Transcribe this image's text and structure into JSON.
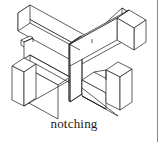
{
  "figure": {
    "caption": "notching",
    "alt_title": "notching",
    "drawing_type": "isometric-line-drawing",
    "stroke_color": "#1a1a1a",
    "fill_color": "#ffffff",
    "background_color": "#ffffff",
    "stroke_width": 0.7,
    "parts": [
      {
        "name": "horizontal-beam",
        "label": "horizontal beam running upper-left to lower-right"
      },
      {
        "name": "crossing-beam",
        "label": "crossing beam running upper-right to lower-left"
      },
      {
        "name": "left-notch-block",
        "label": "left notched end block"
      },
      {
        "name": "right-notch-block",
        "label": "right notched end block"
      },
      {
        "name": "notch-detail",
        "label": "small rectangular notch cut on left beam face"
      }
    ]
  },
  "margin": {
    "rule_color": "#8a8a8a",
    "rule_label": "page margin rule"
  }
}
